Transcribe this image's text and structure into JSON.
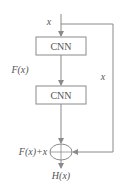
{
  "diagram": {
    "input_label": "x",
    "blocks": [
      {
        "label": "CNN"
      },
      {
        "label": "CNN"
      }
    ],
    "residual_label": "F(x)",
    "skip_label": "x",
    "sum_label": "F(x)+x",
    "output_label": "H(x)",
    "colors": {
      "stroke": "#8a8a8a",
      "text": "#555555",
      "background": "#ffffff"
    }
  }
}
